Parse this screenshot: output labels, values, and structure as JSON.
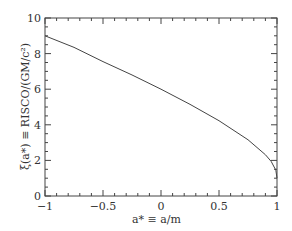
{
  "chart_data": {
    "type": "line",
    "title": "",
    "xlabel": "a* ≡ a/m",
    "ylabel": "ξ(a*) ≡ R_ISCO/(GM/c²)",
    "xlim": [
      -1,
      1
    ],
    "ylim": [
      0,
      10
    ],
    "x_ticks": [
      "-1",
      "-0.5",
      "0",
      "0.5",
      "1"
    ],
    "y_ticks": [
      "0",
      "2",
      "4",
      "6",
      "8",
      "10"
    ],
    "grid": false,
    "series": [
      {
        "name": "ISCO radius",
        "x": [
          -1,
          -0.75,
          -0.5,
          -0.25,
          0,
          0.25,
          0.5,
          0.75,
          0.9,
          0.95,
          0.99,
          1
        ],
        "y": [
          9,
          8.35,
          7.55,
          6.8,
          6,
          5.15,
          4.23,
          3.16,
          2.32,
          1.94,
          1.45,
          1
        ]
      }
    ]
  },
  "labels": {
    "xlabel": "a* ≡ a/m",
    "ylabel": "ξ(a*) ≡ RISCO/(GM/c²)"
  }
}
